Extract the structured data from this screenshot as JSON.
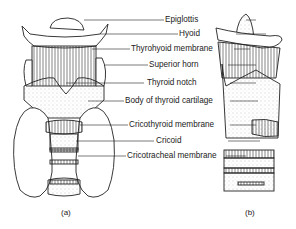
{
  "diagram": {
    "type": "anatomical-illustration",
    "labels": [
      {
        "text": "Epiglottis",
        "y": 20
      },
      {
        "text": "Hyoid",
        "y": 34
      },
      {
        "text": "Thyrohyoid membrane",
        "y": 49
      },
      {
        "text": "Superior horn",
        "y": 65
      },
      {
        "text": "Thyroid notch",
        "y": 83
      },
      {
        "text": "Body of thyroid cartilage",
        "y": 101
      },
      {
        "text": "Cricothyroid membrane",
        "y": 125
      },
      {
        "text": "Cricoid",
        "y": 141
      },
      {
        "text": "Cricotracheal membrane",
        "y": 156
      }
    ],
    "captions": {
      "left": "(a)",
      "right": "(b)"
    }
  }
}
